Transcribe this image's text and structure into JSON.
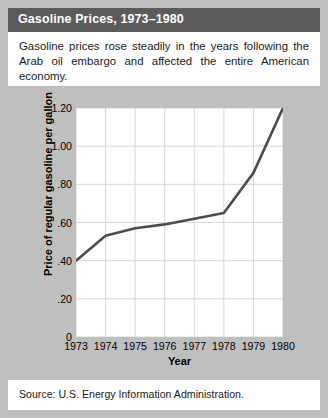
{
  "title": "Gasoline Prices, 1973–1980",
  "description": "Gasoline prices rose steadily in the years following the Arab oil embargo and affected the entire American economy.",
  "footer": "Source: U.S. Energy Information Administration.",
  "colors": {
    "title_bar": "#5b5b5b",
    "title_text": "#ffffff",
    "panel_background": "#bfbfbf",
    "plot_background": "#ffffff",
    "grid": "#d8d8d8",
    "line": "#4d4d4d",
    "text": "#000000"
  },
  "chart_data": {
    "type": "line",
    "title": "Gasoline Prices, 1973–1980",
    "xlabel": "Year",
    "ylabel": "Price of regular gasoline per gallon",
    "x": [
      1973,
      1974,
      1975,
      1976,
      1977,
      1978,
      1979,
      1980
    ],
    "categories": [
      "1973",
      "1974",
      "1975",
      "1976",
      "1977",
      "1978",
      "1979",
      "1980"
    ],
    "values": [
      0.4,
      0.53,
      0.57,
      0.59,
      0.62,
      0.65,
      0.86,
      1.2
    ],
    "series": [
      {
        "name": "Price of regular gasoline per gallon",
        "values": [
          0.4,
          0.53,
          0.57,
          0.59,
          0.62,
          0.65,
          0.86,
          1.2
        ]
      }
    ],
    "xlim": [
      1973,
      1980
    ],
    "ylim": [
      0,
      1.2
    ],
    "ytick_labels": [
      "1.20",
      "1.00",
      ".80",
      ".60",
      ".40",
      ".20",
      "0"
    ],
    "ytick_values": [
      1.2,
      1.0,
      0.8,
      0.6,
      0.4,
      0.2,
      0
    ],
    "xtick_labels": [
      "1973",
      "1974",
      "1975",
      "1976",
      "1977",
      "1978",
      "1979",
      "1980"
    ],
    "grid": true,
    "legend": "none"
  }
}
